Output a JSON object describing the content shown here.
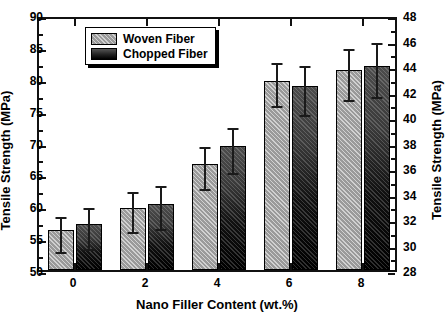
{
  "chart_data": {
    "type": "bar",
    "title": "",
    "xlabel": "Nano Filler Content (wt.%)",
    "ylabel": "Tensile Strength (MPa)",
    "ylabel_secondary": "Tensile Strength (MPa)",
    "categories": [
      "0",
      "2",
      "4",
      "6",
      "8"
    ],
    "ylim": [
      50,
      90
    ],
    "yticks": [
      "50",
      "55",
      "60",
      "65",
      "70",
      "75",
      "80",
      "85",
      "90"
    ],
    "ylim_secondary": [
      28,
      48
    ],
    "yticks_secondary": [
      "28",
      "30",
      "32",
      "34",
      "36",
      "38",
      "40",
      "42",
      "44",
      "46",
      "48"
    ],
    "grid": false,
    "legend_position": "top-left",
    "series": [
      {
        "name": "Woven Fiber",
        "fill": "hatched-light-gray",
        "color": "#9a9a9a",
        "values": [
          56.2,
          59.7,
          66.7,
          79.7,
          81.3
        ],
        "errors": [
          2.7,
          3.1,
          3.3,
          3.4,
          4.0
        ]
      },
      {
        "name": "Chopped Fiber",
        "fill": "solid-black-gradient",
        "color": "#000000",
        "values": [
          57.2,
          60.4,
          69.4,
          78.8,
          82.0
        ],
        "errors": [
          3.2,
          3.4,
          3.5,
          3.9,
          4.2
        ]
      }
    ]
  },
  "legend": {
    "items": [
      {
        "label": "Woven Fiber"
      },
      {
        "label": "Chopped Fiber"
      }
    ]
  }
}
